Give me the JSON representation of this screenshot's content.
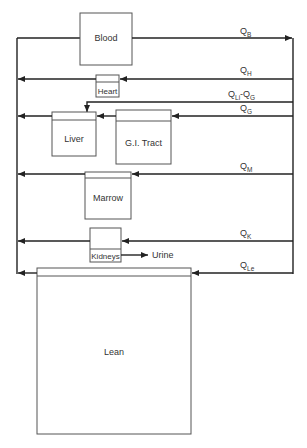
{
  "diagram": {
    "title": "",
    "compartments": {
      "blood": {
        "label": "Blood"
      },
      "heart": {
        "label": "Heart"
      },
      "liver": {
        "label": "Liver"
      },
      "gi_tract": {
        "label": "G.I. Tract"
      },
      "marrow": {
        "label": "Marrow"
      },
      "kidneys": {
        "label": "Kidneys"
      },
      "lean": {
        "label": "Lean"
      }
    },
    "outputs": {
      "urine": {
        "label": "Urine"
      }
    },
    "flows": {
      "qb": {
        "main": "Q",
        "sub": "B"
      },
      "qh": {
        "main": "Q",
        "sub": "H"
      },
      "qli_qg": {
        "main": "Q",
        "sub": "Li",
        "minus": "-Q",
        "sub2": "G"
      },
      "qg": {
        "main": "Q",
        "sub": "G"
      },
      "qm": {
        "main": "Q",
        "sub": "M"
      },
      "qk": {
        "main": "Q",
        "sub": "K"
      },
      "qle": {
        "main": "Q",
        "sub": "Le"
      }
    },
    "colors": {
      "line": "#222222",
      "box": "#555555",
      "background": "#ffffff"
    }
  }
}
